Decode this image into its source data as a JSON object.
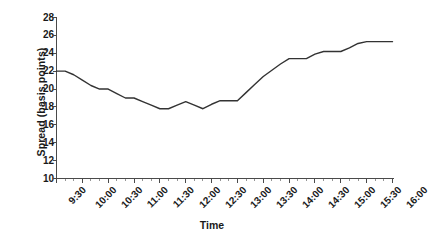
{
  "chart_data": {
    "type": "line",
    "title": "",
    "xlabel": "Time",
    "ylabel": "Spread (basis points)",
    "ylim": [
      10,
      28
    ],
    "ytick_values": [
      10,
      12,
      14,
      16,
      18,
      20,
      22,
      24,
      26,
      28
    ],
    "ytick_labels": [
      "10",
      "12",
      "14",
      "16",
      "18",
      "20",
      "22",
      "24",
      "26",
      "28"
    ],
    "grid": false,
    "legend": false,
    "xtick_labels": [
      "9:30",
      "10:00",
      "10:30",
      "11:00",
      "11:30",
      "12:00",
      "12:30",
      "13:00",
      "13:30",
      "14:00",
      "14:30",
      "15:00",
      "15:30",
      "16:00"
    ],
    "x": [
      "9:30",
      "9:40",
      "9:50",
      "10:00",
      "10:10",
      "10:20",
      "10:30",
      "10:40",
      "10:50",
      "11:00",
      "11:10",
      "11:20",
      "11:30",
      "11:40",
      "11:50",
      "12:00",
      "12:10",
      "12:20",
      "12:30",
      "12:40",
      "12:50",
      "13:00",
      "13:10",
      "13:20",
      "13:30",
      "13:40",
      "13:50",
      "14:00",
      "14:10",
      "14:20",
      "14:30",
      "14:40",
      "14:50",
      "15:00",
      "15:10",
      "15:20",
      "15:30",
      "15:40",
      "15:50",
      "16:00"
    ],
    "series": [
      {
        "name": "Spread",
        "color": "#333333",
        "values": [
          22.0,
          22.0,
          21.6,
          21.0,
          20.4,
          20.0,
          20.0,
          19.5,
          19.0,
          19.0,
          18.6,
          18.2,
          17.8,
          17.8,
          18.2,
          18.6,
          18.2,
          17.8,
          18.3,
          18.7,
          18.7,
          18.7,
          19.6,
          20.5,
          21.4,
          22.1,
          22.8,
          23.4,
          23.4,
          23.4,
          23.9,
          24.2,
          24.2,
          24.2,
          24.6,
          25.1,
          25.3,
          25.3,
          25.3,
          25.3
        ]
      }
    ]
  },
  "axis": {
    "y_title": "Spread (basis points)",
    "x_title": "Time"
  }
}
